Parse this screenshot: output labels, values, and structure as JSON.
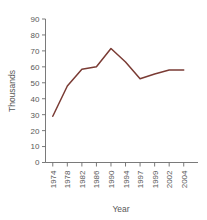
{
  "chart_data": {
    "type": "line",
    "title": "",
    "xlabel": "Year",
    "ylabel": "Thousands",
    "categories": [
      "1974",
      "1978",
      "1982",
      "1986",
      "1990",
      "1994",
      "1997",
      "1999",
      "2002",
      "2004"
    ],
    "values": [
      29,
      48,
      58.5,
      60,
      71.5,
      63,
      52.5,
      55.5,
      58,
      58
    ],
    "series": [
      {
        "name": "Thousands",
        "values": [
          29,
          48,
          58.5,
          60,
          71.5,
          63,
          52.5,
          55.5,
          58,
          58
        ]
      }
    ],
    "ylim": [
      0,
      90
    ],
    "y_ticks": [
      0,
      10,
      20,
      30,
      40,
      50,
      60,
      70,
      80,
      90
    ],
    "y_tick_labels": [
      "0",
      "10",
      "20",
      "30",
      "40",
      "50",
      "60",
      "70",
      "80",
      "90"
    ],
    "x_tick_labels": [
      "1974",
      "1978",
      "1982",
      "1986",
      "1990",
      "1994",
      "1997",
      "1999",
      "2002",
      "2004"
    ],
    "grid": false,
    "legend": "none",
    "line_color": "#7a3b34",
    "axis_color": "#6b6b6b",
    "text_color": "#585858",
    "background_color": "#ffffff",
    "x_tick_label_rotation": "-90",
    "y_axis_title_rotation": "-90"
  },
  "axes": {
    "y_title": "Thousands",
    "x_title": "Year"
  }
}
